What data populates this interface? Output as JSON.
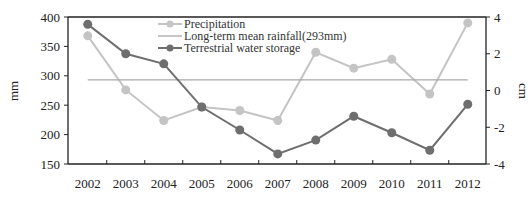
{
  "chart_data": {
    "type": "line",
    "title": "",
    "xlabel": "",
    "ylabel": "mm",
    "y2label": "cm",
    "categories": [
      "2002",
      "2003",
      "2004",
      "2005",
      "2006",
      "2007",
      "2008",
      "2009",
      "2010",
      "2011",
      "2012"
    ],
    "ylim": [
      150,
      400
    ],
    "y_ticks": [
      150,
      200,
      250,
      300,
      350,
      400
    ],
    "y2lim": [
      -4,
      4
    ],
    "y2_ticks": [
      -4,
      -2,
      0,
      2,
      4
    ],
    "grid": false,
    "legend_position": "top-left-inside",
    "series": [
      {
        "name": "Precipitation",
        "axis": "left",
        "color": "#c4c4c4",
        "marker": "circle",
        "values": [
          368,
          276,
          224,
          247,
          241,
          224,
          340,
          313,
          328,
          269,
          390
        ]
      },
      {
        "name": "Long-term mean rainfall(293mm)",
        "axis": "left",
        "color": "#a9a9a9",
        "marker": "none",
        "values": [
          293,
          293,
          293,
          293,
          293,
          293,
          293,
          293,
          293,
          293,
          293
        ]
      },
      {
        "name": "Terrestrial water storage",
        "axis": "right",
        "color": "#6e6e6e",
        "marker": "circle",
        "values": [
          3.6,
          2.0,
          1.45,
          -0.9,
          -2.15,
          -3.45,
          -2.7,
          -1.4,
          -2.3,
          -3.25,
          -0.75
        ]
      }
    ]
  }
}
